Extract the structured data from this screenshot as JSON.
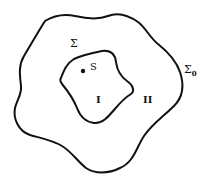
{
  "diagram": {
    "type": "nested-regions",
    "colors": {
      "stroke": "#111111",
      "background": "#ffffff"
    },
    "curves": [
      {
        "id": "outer",
        "label": "Σ₀",
        "label_main": "Σ",
        "label_sub": "0"
      },
      {
        "id": "inner",
        "label": "Σ"
      }
    ],
    "point": {
      "label": "S"
    },
    "regions": [
      {
        "id": "region-1",
        "label": "I"
      },
      {
        "id": "region-2",
        "label": "II"
      }
    ]
  }
}
